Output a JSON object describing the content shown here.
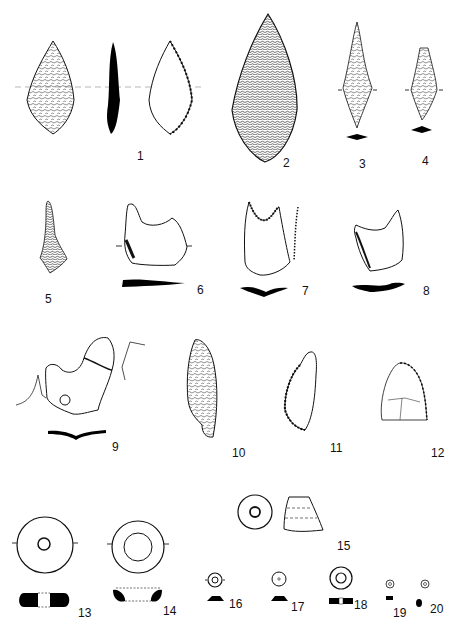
{
  "plate": {
    "background": "#ffffff",
    "ink": "#111111",
    "figures": [
      {
        "id": 1,
        "label": "1",
        "type": "leaf-shaped point, two faces and section"
      },
      {
        "id": 2,
        "label": "2",
        "type": "bifacial leaf point"
      },
      {
        "id": 3,
        "label": "3",
        "type": "lanceolate point"
      },
      {
        "id": 4,
        "label": "4",
        "type": "lanceolate point"
      },
      {
        "id": 5,
        "label": "5",
        "type": "tanged point"
      },
      {
        "id": 6,
        "label": "6",
        "type": "notched blade"
      },
      {
        "id": 7,
        "label": "7",
        "type": "notched blade"
      },
      {
        "id": 8,
        "label": "8",
        "type": "notched blade"
      },
      {
        "id": 9,
        "label": "9",
        "type": "notched flake"
      },
      {
        "id": 10,
        "label": "10",
        "type": "retouched blade"
      },
      {
        "id": 11,
        "label": "11",
        "type": "retouched flake"
      },
      {
        "id": 12,
        "label": "12",
        "type": "triangular scraper"
      },
      {
        "id": 13,
        "label": "13",
        "type": "disc bead"
      },
      {
        "id": 14,
        "label": "14",
        "type": "ring bead"
      },
      {
        "id": 15,
        "label": "15",
        "type": "conical bead"
      },
      {
        "id": 16,
        "label": "16",
        "type": "small bead"
      },
      {
        "id": 17,
        "label": "17",
        "type": "small bead"
      },
      {
        "id": 18,
        "label": "18",
        "type": "small bead"
      },
      {
        "id": 19,
        "label": "19",
        "type": "micro bead"
      },
      {
        "id": 20,
        "label": "20",
        "type": "micro bead"
      }
    ]
  }
}
